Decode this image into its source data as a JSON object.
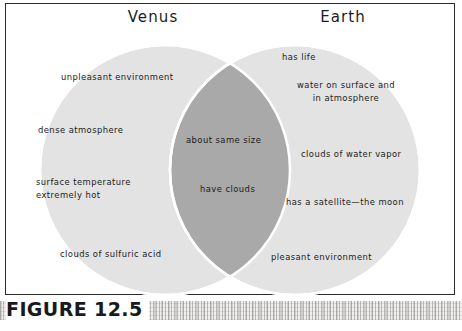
{
  "figure": {
    "caption": "FIGURE 12.5",
    "border_color": "#2b2b2b"
  },
  "diagram": {
    "type": "venn",
    "left_circle": {
      "title": "Venus",
      "fill_color": "#e3e3e3",
      "items": [
        "unpleasant environment",
        "dense atmosphere",
        "surface temperature\nextremely hot",
        "clouds of sulfuric acid"
      ]
    },
    "right_circle": {
      "title": "Earth",
      "fill_color": "#e3e3e3",
      "items": [
        "has life",
        "water on surface and\nin atmosphere",
        "clouds of water vapor",
        "has a satellite—the moon",
        "pleasant environment"
      ]
    },
    "intersection": {
      "fill_color": "#a9a9a9",
      "items": [
        "about same size",
        "have clouds"
      ]
    }
  }
}
